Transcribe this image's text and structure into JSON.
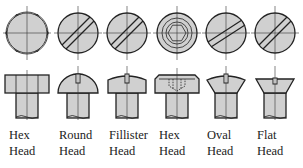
{
  "diagram": {
    "fill_color": "#d0d0d0",
    "stroke_color": "#222222",
    "items": [
      {
        "id": "hex-head",
        "line1": "Hex",
        "line2": "Head",
        "cx": 27
      },
      {
        "id": "round-head",
        "line1": "Round",
        "line2": "Head",
        "cx": 78
      },
      {
        "id": "fillister-head",
        "line1": "Fillister",
        "line2": "Head",
        "cx": 127
      },
      {
        "id": "socket-hex-head",
        "line1": "Hex",
        "line2": "Head",
        "cx": 177
      },
      {
        "id": "oval-head",
        "line1": "Oval",
        "line2": "Head",
        "cx": 226
      },
      {
        "id": "flat-head",
        "line1": "Flat",
        "line2": "Head",
        "cx": 275
      }
    ]
  }
}
